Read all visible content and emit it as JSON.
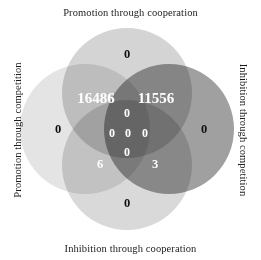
{
  "figure": {
    "labels": {
      "top": "Promotion through cooperation",
      "bottom": "Inhibition through cooperation",
      "left": "Promotion through competition",
      "right": "Inhibition through competition"
    }
  },
  "chart_data": {
    "type": "venn",
    "title": "",
    "sets": [
      {
        "id": "promotion_cooperation",
        "label": "Promotion through cooperation",
        "position": "top",
        "color": "#d4d4d4"
      },
      {
        "id": "inhibition_competition",
        "label": "Inhibition through competition",
        "position": "right",
        "color": "#a0a0a0"
      },
      {
        "id": "inhibition_cooperation",
        "label": "Inhibition through cooperation",
        "position": "bottom",
        "color": "#d9d9d9"
      },
      {
        "id": "promotion_competition",
        "label": "Promotion through competition",
        "position": "left",
        "color": "#e4e4e4"
      }
    ],
    "regions": [
      {
        "id": "top-only",
        "sets": [
          "promotion_cooperation"
        ],
        "value": "0",
        "x": 127,
        "y": 54,
        "style": "light",
        "size": "mid"
      },
      {
        "id": "left-only",
        "sets": [
          "promotion_competition"
        ],
        "value": "0",
        "x": 58,
        "y": 129,
        "style": "light",
        "size": "mid"
      },
      {
        "id": "right-only",
        "sets": [
          "inhibition_competition"
        ],
        "value": "0",
        "x": 204,
        "y": 129,
        "style": "light",
        "size": "mid"
      },
      {
        "id": "bottom-only",
        "sets": [
          "inhibition_cooperation"
        ],
        "value": "0",
        "x": 127,
        "y": 203,
        "style": "light",
        "size": "mid"
      },
      {
        "id": "top-left",
        "sets": [
          "promotion_cooperation",
          "promotion_competition"
        ],
        "value": "16486",
        "x": 96,
        "y": 98,
        "style": "dark",
        "size": "big"
      },
      {
        "id": "top-right",
        "sets": [
          "promotion_cooperation",
          "inhibition_competition"
        ],
        "value": "11556",
        "x": 156,
        "y": 98,
        "style": "dark",
        "size": "big"
      },
      {
        "id": "bottom-left",
        "sets": [
          "inhibition_cooperation",
          "promotion_competition"
        ],
        "value": "6",
        "x": 100,
        "y": 164,
        "style": "dark",
        "size": "mid"
      },
      {
        "id": "bottom-right",
        "sets": [
          "inhibition_cooperation",
          "inhibition_competition"
        ],
        "value": "3",
        "x": 155,
        "y": 164,
        "style": "dark",
        "size": "mid"
      },
      {
        "id": "upper-center",
        "sets": [
          "promotion_cooperation",
          "promotion_competition",
          "inhibition_competition"
        ],
        "value": "0",
        "x": 127,
        "y": 113,
        "style": "dark",
        "size": "small"
      },
      {
        "id": "center-left",
        "sets": [
          "promotion_cooperation",
          "promotion_competition",
          "inhibition_cooperation"
        ],
        "value": "0",
        "x": 112,
        "y": 133,
        "style": "dark",
        "size": "small"
      },
      {
        "id": "center-middle",
        "sets": [
          "promotion_cooperation",
          "promotion_competition",
          "inhibition_competition",
          "inhibition_cooperation"
        ],
        "value": "0",
        "x": 128,
        "y": 133,
        "style": "dark",
        "size": "small"
      },
      {
        "id": "center-right",
        "sets": [
          "promotion_cooperation",
          "inhibition_competition",
          "inhibition_cooperation"
        ],
        "value": "0",
        "x": 145,
        "y": 133,
        "style": "dark",
        "size": "small"
      },
      {
        "id": "lower-center",
        "sets": [
          "promotion_competition",
          "inhibition_competition",
          "inhibition_cooperation"
        ],
        "value": "0",
        "x": 127,
        "y": 152,
        "style": "dark",
        "size": "small"
      }
    ]
  }
}
